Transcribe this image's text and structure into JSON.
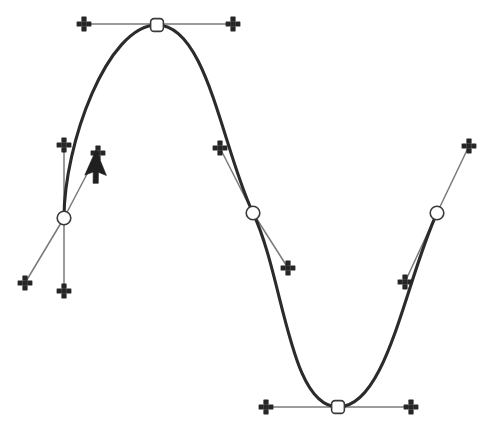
{
  "scene": {
    "title": "Bezier path with control handles",
    "width": 494,
    "height": 429,
    "background_color": "#ffffff",
    "path_color": "#2b2b2b",
    "handle_line_color": "#7a7a7a",
    "anchor_fill_color": "#ffffff",
    "anchor_stroke_color": "#3a3a3a",
    "knob_color": "#262626",
    "cursor_color": "#1f1f1f"
  },
  "path": {
    "name": "sine-wave-path",
    "stroke_width": 3.1,
    "d": "M 64 218 C 64 145 107 25 157 25 C 207 25 222 148 253 213 C 284 278 289 407 338 407 C 387 407 405 282 437 213"
  },
  "anchors": [
    {
      "id": "anchor-1",
      "shape": "circle",
      "x": 64,
      "y": 218,
      "selected": true,
      "label": "anchor-point-1"
    },
    {
      "id": "anchor-2",
      "shape": "square",
      "x": 157,
      "y": 25,
      "selected": true,
      "label": "anchor-point-2"
    },
    {
      "id": "anchor-3",
      "shape": "circle",
      "x": 253,
      "y": 213,
      "selected": true,
      "label": "anchor-point-3"
    },
    {
      "id": "anchor-4",
      "shape": "square",
      "x": 338,
      "y": 407,
      "selected": true,
      "label": "anchor-point-4"
    },
    {
      "id": "anchor-5",
      "shape": "circle",
      "x": 437,
      "y": 213,
      "selected": true,
      "label": "anchor-point-5"
    }
  ],
  "handles": [
    {
      "id": "handle-1-original-in",
      "anchor": "anchor-1",
      "x1": 64,
      "y1": 218,
      "x2": 64,
      "y2": 145,
      "state": "original"
    },
    {
      "id": "handle-1-original-out",
      "anchor": "anchor-1",
      "x1": 64,
      "y1": 218,
      "x2": 64,
      "y2": 291,
      "state": "original"
    },
    {
      "id": "handle-1-dragged-in",
      "anchor": "anchor-1",
      "x1": 64,
      "y1": 218,
      "x2": 98,
      "y2": 153,
      "state": "dragging"
    },
    {
      "id": "handle-1-dragged-out",
      "anchor": "anchor-1",
      "x1": 64,
      "y1": 218,
      "x2": 25,
      "y2": 283,
      "state": "dragging"
    },
    {
      "id": "handle-2-in",
      "anchor": "anchor-2",
      "x1": 157,
      "y1": 24,
      "x2": 84,
      "y2": 24,
      "state": "original"
    },
    {
      "id": "handle-2-out",
      "anchor": "anchor-2",
      "x1": 157,
      "y1": 24,
      "x2": 233,
      "y2": 24,
      "state": "original"
    },
    {
      "id": "handle-3-in",
      "anchor": "anchor-3",
      "x1": 253,
      "y1": 213,
      "x2": 220,
      "y2": 148,
      "state": "original"
    },
    {
      "id": "handle-3-out",
      "anchor": "anchor-3",
      "x1": 253,
      "y1": 213,
      "x2": 288,
      "y2": 268,
      "state": "original"
    },
    {
      "id": "handle-4-in",
      "anchor": "anchor-4",
      "x1": 338,
      "y1": 407,
      "x2": 266,
      "y2": 407,
      "state": "original"
    },
    {
      "id": "handle-4-out",
      "anchor": "anchor-4",
      "x1": 338,
      "y1": 407,
      "x2": 411,
      "y2": 407,
      "state": "original"
    },
    {
      "id": "handle-5-in",
      "anchor": "anchor-5",
      "x1": 437,
      "y1": 213,
      "x2": 405,
      "y2": 282,
      "state": "original"
    },
    {
      "id": "handle-5-out",
      "anchor": "anchor-5",
      "x1": 437,
      "y1": 213,
      "x2": 469,
      "y2": 146,
      "state": "original"
    }
  ],
  "knobs": [
    {
      "id": "knob-1a",
      "x": 64,
      "y": 145,
      "label": "handle-knob"
    },
    {
      "id": "knob-1b",
      "x": 64,
      "y": 291,
      "label": "handle-knob"
    },
    {
      "id": "knob-1c",
      "x": 98,
      "y": 153,
      "label": "handle-knob-dragging"
    },
    {
      "id": "knob-1d",
      "x": 25,
      "y": 283,
      "label": "handle-knob-dragging"
    },
    {
      "id": "knob-2a",
      "x": 84,
      "y": 24,
      "label": "handle-knob"
    },
    {
      "id": "knob-2b",
      "x": 233,
      "y": 24,
      "label": "handle-knob"
    },
    {
      "id": "knob-3a",
      "x": 220,
      "y": 148,
      "label": "handle-knob"
    },
    {
      "id": "knob-3b",
      "x": 288,
      "y": 268,
      "label": "handle-knob"
    },
    {
      "id": "knob-4a",
      "x": 266,
      "y": 407,
      "label": "handle-knob"
    },
    {
      "id": "knob-4b",
      "x": 411,
      "y": 407,
      "label": "handle-knob"
    },
    {
      "id": "knob-5a",
      "x": 405,
      "y": 282,
      "label": "handle-knob"
    },
    {
      "id": "knob-5b",
      "x": 469,
      "y": 146,
      "label": "handle-knob"
    }
  ],
  "cursor": {
    "id": "mouse-cursor",
    "type": "arrow-pointer",
    "tip_x": 96,
    "tip_y": 150,
    "rotation_deg": 24,
    "label": "mouse-pointer"
  }
}
